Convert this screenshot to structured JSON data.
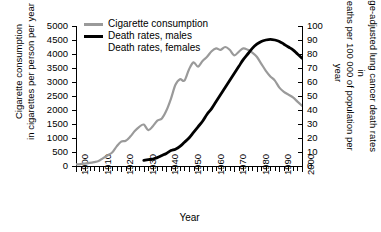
{
  "chart_data": {
    "type": "line",
    "title": "",
    "xlabel": "Year",
    "ylabel_left_line1": "Cigarette consumption",
    "ylabel_left_line2": "in cigarettes per person per year",
    "ylabel_right_line1": "Age-adjusted lung cancer death rates in",
    "ylabel_right_line2": "deaths per 100 000 of population per year",
    "xlim": [
      1900,
      2000
    ],
    "ylim_left": [
      0,
      5000
    ],
    "ylim_right": [
      0,
      100
    ],
    "x_ticks": [
      1900,
      1910,
      1920,
      1930,
      1940,
      1950,
      1960,
      1970,
      1980,
      1990,
      2000
    ],
    "x_tick_labels": [
      "1900",
      "1910",
      "1920",
      "1930",
      "1940",
      "1950",
      "1960",
      "1970",
      "1980",
      "1990",
      "2000"
    ],
    "x_minor_tick_interval": 2,
    "y_ticks_left": [
      0,
      500,
      1000,
      1500,
      2000,
      2500,
      3000,
      3500,
      4000,
      4500,
      5000
    ],
    "y_tick_labels_left": [
      "0",
      "500",
      "1000",
      "1500",
      "2000",
      "2500",
      "3000",
      "3500",
      "4000",
      "4500",
      "5000"
    ],
    "y_ticks_right": [
      0,
      10,
      20,
      30,
      40,
      50,
      60,
      70,
      80,
      90,
      100
    ],
    "y_tick_labels_right": [
      "0",
      "10",
      "20",
      "30",
      "40",
      "50",
      "60",
      "70",
      "80",
      "90",
      "100"
    ],
    "grid": false,
    "legend_position": "top-left",
    "series": [
      {
        "name": "Cigarette consumption",
        "axis": "left",
        "color": "#9a9a9a",
        "width": 2.2,
        "points": [
          [
            1900,
            55
          ],
          [
            1902,
            70
          ],
          [
            1904,
            90
          ],
          [
            1906,
            110
          ],
          [
            1908,
            140
          ],
          [
            1910,
            180
          ],
          [
            1912,
            280
          ],
          [
            1914,
            380
          ],
          [
            1916,
            480
          ],
          [
            1918,
            700
          ],
          [
            1920,
            870
          ],
          [
            1922,
            900
          ],
          [
            1924,
            1050
          ],
          [
            1926,
            1250
          ],
          [
            1928,
            1400
          ],
          [
            1930,
            1480
          ],
          [
            1932,
            1280
          ],
          [
            1934,
            1420
          ],
          [
            1936,
            1620
          ],
          [
            1938,
            1700
          ],
          [
            1940,
            1980
          ],
          [
            1942,
            2400
          ],
          [
            1944,
            2900
          ],
          [
            1946,
            3100
          ],
          [
            1948,
            3050
          ],
          [
            1950,
            3450
          ],
          [
            1952,
            3700
          ],
          [
            1954,
            3550
          ],
          [
            1956,
            3750
          ],
          [
            1958,
            3900
          ],
          [
            1960,
            4100
          ],
          [
            1962,
            4200
          ],
          [
            1964,
            4150
          ],
          [
            1966,
            4250
          ],
          [
            1968,
            4150
          ],
          [
            1970,
            3950
          ],
          [
            1972,
            4080
          ],
          [
            1974,
            4200
          ],
          [
            1976,
            4150
          ],
          [
            1978,
            4050
          ],
          [
            1980,
            3900
          ],
          [
            1982,
            3650
          ],
          [
            1984,
            3400
          ],
          [
            1986,
            3200
          ],
          [
            1988,
            3050
          ],
          [
            1990,
            2800
          ],
          [
            1992,
            2650
          ],
          [
            1994,
            2550
          ],
          [
            1996,
            2450
          ],
          [
            1998,
            2300
          ],
          [
            2000,
            2150
          ]
        ]
      },
      {
        "name": "Death rates, males",
        "axis": "right",
        "color": "#000000",
        "width": 2.8,
        "points": [
          [
            1930,
            4
          ],
          [
            1932,
            4.5
          ],
          [
            1934,
            5
          ],
          [
            1936,
            6
          ],
          [
            1938,
            7.5
          ],
          [
            1940,
            9
          ],
          [
            1942,
            11
          ],
          [
            1944,
            12
          ],
          [
            1946,
            14
          ],
          [
            1948,
            17
          ],
          [
            1950,
            20
          ],
          [
            1952,
            24
          ],
          [
            1954,
            28
          ],
          [
            1956,
            32
          ],
          [
            1958,
            37
          ],
          [
            1960,
            41
          ],
          [
            1962,
            46
          ],
          [
            1964,
            51
          ],
          [
            1966,
            56
          ],
          [
            1968,
            61
          ],
          [
            1970,
            66
          ],
          [
            1972,
            71
          ],
          [
            1974,
            76
          ],
          [
            1976,
            80
          ],
          [
            1978,
            84
          ],
          [
            1980,
            87
          ],
          [
            1982,
            89
          ],
          [
            1984,
            90
          ],
          [
            1986,
            90.5
          ],
          [
            1988,
            90
          ],
          [
            1990,
            89
          ],
          [
            1992,
            87
          ],
          [
            1994,
            85
          ],
          [
            1996,
            83
          ],
          [
            1998,
            80
          ],
          [
            2000,
            77
          ]
        ]
      },
      {
        "name": "Death rates, females",
        "axis": "right",
        "color": "#000000",
        "width": 1.4,
        "points": []
      }
    ]
  },
  "legend": {
    "items": [
      {
        "label": "Cigarette consumption",
        "swatch": "gray-line"
      },
      {
        "label": "Death rates, males",
        "swatch": "black-line"
      },
      {
        "label": "Death rates, females",
        "swatch": "none"
      }
    ]
  }
}
